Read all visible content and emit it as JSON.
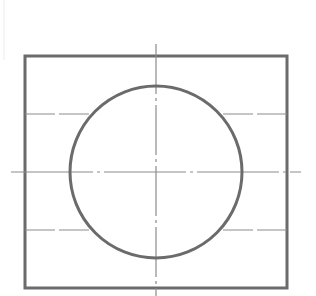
{
  "drawing": {
    "title": "",
    "view": "front view: cylinder in square block",
    "colors": {
      "background": "#ffffff",
      "outline": "#6b6b6b",
      "centerline": "#8c8c8c",
      "hidden": "#8c8c8c",
      "edge_mark": "#ececec"
    },
    "square": {
      "x": 25,
      "y": 56,
      "width": 262,
      "height": 232,
      "stroke_width": 3
    },
    "circle": {
      "cx": 156,
      "cy": 172,
      "r": 86,
      "stroke_width": 3
    },
    "centerline_horizontal": {
      "x1": 11,
      "x2": 301,
      "y": 172,
      "dash": "82 4 3 4"
    },
    "centerline_vertical": {
      "x": 156,
      "y1": 44,
      "y2": 296,
      "dash": "50 4 3 4"
    },
    "hidden_lines": [
      {
        "y": 114,
        "left": [
          25,
          90
        ],
        "right": [
          222,
          287
        ]
      },
      {
        "y": 230,
        "left": [
          25,
          90
        ],
        "right": [
          222,
          287
        ]
      }
    ]
  }
}
